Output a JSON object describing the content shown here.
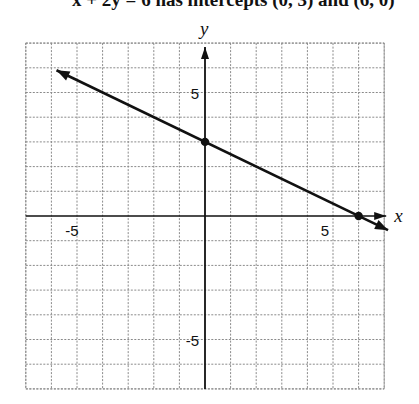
{
  "caption": "x + 2y = 6 has intercepts (0, 3) and (6, 0)",
  "chart_data": {
    "type": "line",
    "title": "",
    "xlabel": "x",
    "ylabel": "y",
    "xlim": [
      -7,
      7
    ],
    "ylim": [
      -7,
      7
    ],
    "grid": true,
    "tick_labels": {
      "x": [
        {
          "value": -5,
          "label": "-5"
        },
        {
          "value": 5,
          "label": "5"
        }
      ],
      "y": [
        {
          "value": 5,
          "label": "5"
        },
        {
          "value": -5,
          "label": "-5"
        }
      ]
    },
    "series": [
      {
        "name": "x + 2y = 6",
        "equation": "x + 2y = 6",
        "x": [
          -5.8,
          7.15
        ],
        "y": [
          5.9,
          -0.575
        ],
        "arrows": "both"
      }
    ],
    "points": [
      {
        "label": "y-intercept",
        "x": 0,
        "y": 3
      },
      {
        "label": "x-intercept",
        "x": 6,
        "y": 0
      }
    ]
  },
  "colors": {
    "ink": "#111111",
    "grid": "#8a8a8a",
    "background": "#ffffff"
  }
}
